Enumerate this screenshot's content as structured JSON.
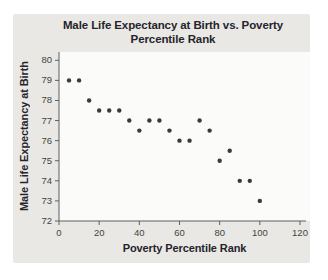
{
  "chart": {
    "title_lines": [
      "Male Life Expectancy at Birth vs. Poverty",
      "Percentile Rank"
    ]
  },
  "chart_data": {
    "type": "scatter",
    "title": "Male Life Expectancy at Birth vs. Poverty Percentile Rank",
    "xlabel": "Poverty Percentile Rank",
    "ylabel": "Male Life Expectancy at Birth",
    "xlim": [
      0,
      120
    ],
    "ylim": [
      72,
      80
    ],
    "x_ticks": [
      0,
      20,
      40,
      60,
      80,
      100,
      120
    ],
    "y_ticks": [
      72,
      73,
      74,
      75,
      76,
      77,
      78,
      79,
      80
    ],
    "grid": false,
    "legend": null,
    "points": [
      [
        5,
        79
      ],
      [
        10,
        79
      ],
      [
        15,
        78
      ],
      [
        20,
        77.5
      ],
      [
        25,
        77.5
      ],
      [
        30,
        77.5
      ],
      [
        35,
        77
      ],
      [
        40,
        76.5
      ],
      [
        45,
        77
      ],
      [
        50,
        77
      ],
      [
        55,
        76.5
      ],
      [
        60,
        76
      ],
      [
        65,
        76
      ],
      [
        70,
        77
      ],
      [
        75,
        76.5
      ],
      [
        80,
        75
      ],
      [
        85,
        75.5
      ],
      [
        90,
        74
      ],
      [
        95,
        74
      ],
      [
        100,
        73
      ]
    ]
  },
  "style": {
    "page_bg": "#ffffff",
    "card_bg": "#e9e8e4",
    "plot_bg": "#fbfbf9",
    "axis_color": "#5e5e5c",
    "tick_label_color": "#454440",
    "title_color": "#24242c",
    "point_color": "#3a3a3c"
  }
}
